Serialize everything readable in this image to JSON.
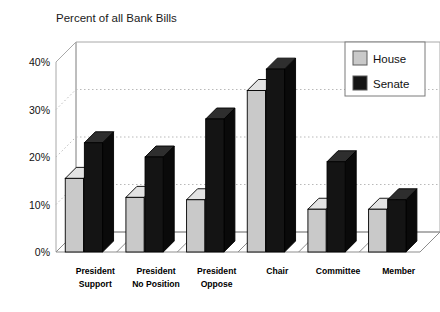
{
  "chart_data": {
    "type": "bar",
    "title": "Percent of all Bank Bills",
    "subtitle": "",
    "xlabel": "",
    "ylabel": "",
    "ylim": [
      0,
      40
    ],
    "ytick_labels": [
      "0%",
      "10%",
      "20%",
      "30%",
      "40%"
    ],
    "ytick_values": [
      0,
      10,
      20,
      30,
      40
    ],
    "grid": true,
    "grid_levels": [
      10,
      20,
      30
    ],
    "legend_position": "top-right",
    "style": "3d-clustered-bars",
    "categories": [
      "President Support",
      "President No Position",
      "President Oppose",
      "Chair",
      "Committee",
      "Member"
    ],
    "category_lines": [
      [
        "President",
        "Support"
      ],
      [
        "President",
        "No Position"
      ],
      [
        "President",
        "Oppose"
      ],
      [
        "Chair",
        ""
      ],
      [
        "Committee",
        ""
      ],
      [
        "Member",
        ""
      ]
    ],
    "series": [
      {
        "name": "House",
        "color": "#c9c9c9",
        "values": [
          15.5,
          11.5,
          11.0,
          34.0,
          9.0,
          9.0
        ]
      },
      {
        "name": "Senate",
        "color": "#111111",
        "values": [
          23.0,
          20.0,
          28.0,
          38.5,
          19.0,
          11.0
        ]
      }
    ]
  },
  "legend": {
    "entries": [
      {
        "label": "House",
        "swatch": "house-swatch"
      },
      {
        "label": "Senate",
        "swatch": "senate-swatch"
      }
    ]
  },
  "colors": {
    "house_face": "#c9c9c9",
    "house_top": "#e3e3e3",
    "house_side": "#ababab",
    "senate_face": "#141414",
    "senate_top": "#2e2e2e",
    "senate_side": "#0a0a0a",
    "axis": "#a8a8a8",
    "grid": "#b9b9b9",
    "text": "#111111",
    "background": "#ffffff"
  }
}
